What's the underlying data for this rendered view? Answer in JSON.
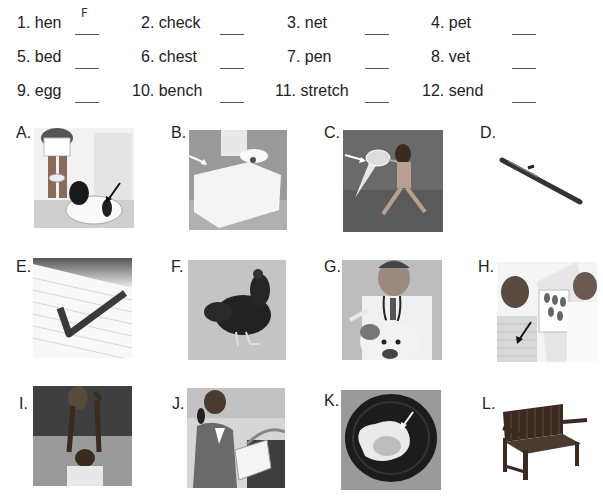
{
  "words": [
    {
      "num": "1.",
      "word": "hen",
      "answer": "F"
    },
    {
      "num": "2.",
      "word": "check",
      "answer": ""
    },
    {
      "num": "3.",
      "word": "net",
      "answer": ""
    },
    {
      "num": "4.",
      "word": "pet",
      "answer": ""
    },
    {
      "num": "5.",
      "word": "bed",
      "answer": ""
    },
    {
      "num": "6.",
      "word": "chest",
      "answer": ""
    },
    {
      "num": "7.",
      "word": "pen",
      "answer": ""
    },
    {
      "num": "8.",
      "word": "vet",
      "answer": ""
    },
    {
      "num": "9.",
      "word": "egg",
      "answer": ""
    },
    {
      "num": "10.",
      "word": "bench",
      "answer": ""
    },
    {
      "num": "11.",
      "word": "stretch",
      "answer": ""
    },
    {
      "num": "12.",
      "word": "send",
      "answer": ""
    }
  ],
  "pictures": [
    {
      "label": "A.",
      "subject": "girl with pet dog, arrow pointing at dog"
    },
    {
      "label": "B.",
      "subject": "bed in bedroom"
    },
    {
      "label": "C.",
      "subject": "child with butterfly net, arrow pointing at net"
    },
    {
      "label": "D.",
      "subject": "pen"
    },
    {
      "label": "E.",
      "subject": "check mark on lined paper"
    },
    {
      "label": "F.",
      "subject": "hen"
    },
    {
      "label": "G.",
      "subject": "vet examining bulldog"
    },
    {
      "label": "H.",
      "subject": "doctor pointing at patient's chest"
    },
    {
      "label": "I.",
      "subject": "child stretching to catch ball"
    },
    {
      "label": "J.",
      "subject": "girl sending mail at mailbox"
    },
    {
      "label": "K.",
      "subject": "fried egg on plate, arrow pointing at egg"
    },
    {
      "label": "L.",
      "subject": "wooden bench"
    }
  ]
}
